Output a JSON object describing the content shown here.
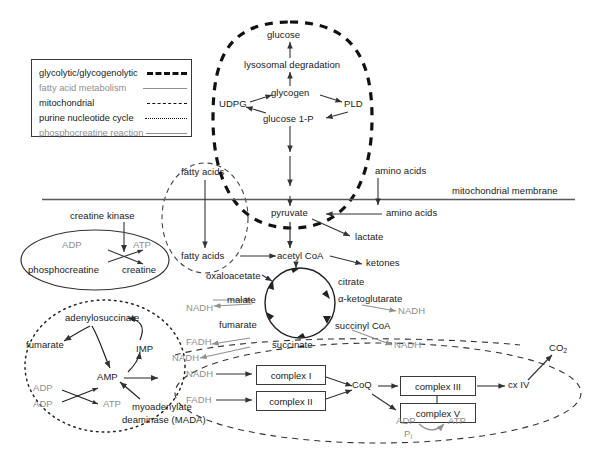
{
  "figure": {
    "type": "metabolic-pathway-diagram",
    "membrane_label": "mitochondrial membrane"
  },
  "legend": {
    "items": [
      {
        "label": "glycolytic/glycogenolytic",
        "style": "thick-dashed",
        "color": "#111111"
      },
      {
        "label": "fatty acid metabolism",
        "style": "solid",
        "color": "#8f8f8f"
      },
      {
        "label": "mitochondrial",
        "style": "dashed",
        "color": "#111111"
      },
      {
        "label": "purine nucleotide cycle",
        "style": "dotted",
        "color": "#111111"
      },
      {
        "label": "phosphocreatine reaction",
        "style": "solid",
        "color": "#8f8f8f"
      }
    ]
  },
  "glycolytic": {
    "glucose": "glucose",
    "lysosomal": "lysosomal degradation",
    "udpg": "UDPG",
    "glycogen": "glycogen",
    "pld": "PLD",
    "glucose1p": "glucose 1-P"
  },
  "membrane": {
    "label": "mitochondrial membrane"
  },
  "fatty": {
    "outer": "fatty acids",
    "inner": "fatty acids"
  },
  "cytosol": {
    "amino_acids_top": "amino acids",
    "amino_acids_in": "amino acids",
    "pyruvate": "pyruvate",
    "lactate": "lactate",
    "acetyl_coa": "acetyl CoA",
    "ketones": "ketones"
  },
  "creatine": {
    "enzyme": "creatine kinase",
    "adp": "ADP",
    "atp": "ATP",
    "phosphocreatine": "phosphocreatine",
    "creatine": "creatine"
  },
  "tca": {
    "oxaloacetate": "oxaloacetate",
    "citrate": "citrate",
    "ketoglutarate": "α-ketoglutarate",
    "succinyl_coa": "succinyl CoA",
    "succinate": "succinate",
    "fumarate": "fumarate",
    "malate": "malate",
    "nadh_left": "NADH",
    "nadh_right": "NADH",
    "nadh_lower_right": "NADH",
    "nadh_lower": "NADH",
    "fadh_left": "FADH"
  },
  "purine": {
    "adenylosuccinate": "adenylosuccinate",
    "fumarate": "fumarate",
    "imp": "IMP",
    "amp": "AMP",
    "adp1": "ADP",
    "adp2": "ADP",
    "atp": "ATP",
    "enzyme_line1": "myoadenylate",
    "enzyme_line2": "deaminase (MADA)"
  },
  "etc": {
    "nadh_in": "NADH",
    "fadh_in": "FADH",
    "complex_i": "complex I",
    "complex_ii": "complex II",
    "coq": "CoQ",
    "complex_iii": "complex III",
    "complex_v": "complex V",
    "cx_iv": "cx IV",
    "co2": "CO",
    "co2_sub": "2",
    "adp": "ADP",
    "pi": "P",
    "pi_sub": "i",
    "atp": "ATP"
  },
  "colors": {
    "black": "#1a1a1a",
    "gray": "#8f8f8f",
    "line": "#5a5a5a"
  }
}
